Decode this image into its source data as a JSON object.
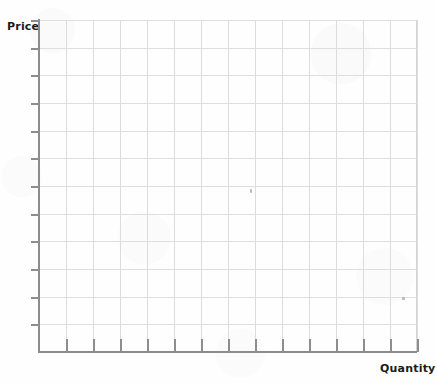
{
  "worksheet": {
    "title": "Blank supply and demand graph grid",
    "background_color": "#fefefe",
    "axis_color": "#8c8c8c",
    "grid_color": "#dcdcdc",
    "label_color": "#1c1c1c"
  },
  "axes": {
    "y": {
      "label": "Price",
      "tick_count": 12,
      "tick_labels": [],
      "line_top": 19,
      "line_bottom": 353
    },
    "x": {
      "label": "Quantity",
      "tick_count": 14,
      "tick_labels": [],
      "line_left": 38,
      "line_right": 417
    }
  },
  "chart_data": {
    "type": "line",
    "title": "",
    "subtitle": "",
    "xlabel": "Quantity",
    "ylabel": "Price",
    "x": [],
    "series": [],
    "categories": [],
    "values": [],
    "xlim": [
      0,
      14
    ],
    "ylim": [
      0,
      12
    ],
    "grid": true,
    "grid_columns": 14,
    "grid_rows": 12,
    "legend": false,
    "legend_position": "none",
    "annotations": [],
    "note": "Empty grid — no data plotted; blank worksheet for drawing supply/demand curves"
  },
  "artifacts": {
    "specks": [
      {
        "x": 250,
        "y": 189,
        "w": 2,
        "h": 4
      },
      {
        "x": 402,
        "y": 297,
        "w": 3,
        "h": 3
      }
    ]
  }
}
